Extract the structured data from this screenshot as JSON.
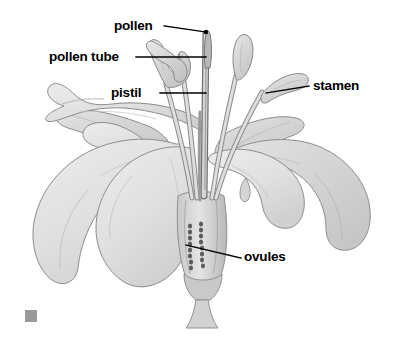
{
  "figure": {
    "kind": "botanical-diagram",
    "background_color": "#ffffff",
    "line_color": "#000000",
    "petal_fill": "#e3e3e3",
    "petal_shade": "#cfcfcf",
    "petal_outline": "#8c8c8c",
    "stem_fill": "#d6d6d6",
    "anther_fill": "#dcdcdc",
    "ovule_color": "#5a5a5a",
    "corner_marker_color": "#9a9a9a"
  },
  "labels": {
    "pollen": "pollen",
    "pollen_tube": "pollen tube",
    "pistil": "pistil",
    "stamen": "stamen",
    "ovules": "ovules"
  }
}
